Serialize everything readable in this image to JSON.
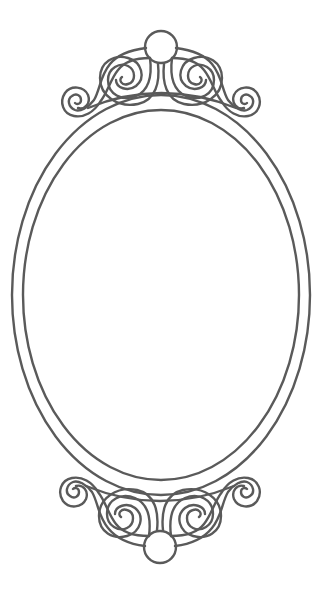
{
  "image": {
    "subject": "Ornamental oval mirror frame line art",
    "background_color": "#ffffff",
    "stroke_color": "#5a5a5a"
  },
  "frame": {
    "outer_oval": {
      "cx": 161,
      "cy": 295,
      "rx": 149,
      "ry": 200
    },
    "inner_oval": {
      "cx": 161,
      "cy": 295,
      "rx": 138,
      "ry": 185
    }
  },
  "ornaments": {
    "top_knob": {
      "cx": 161,
      "cy": 47,
      "r": 16
    },
    "bottom_knob": {
      "cx": 160,
      "cy": 547,
      "r": 16
    }
  }
}
